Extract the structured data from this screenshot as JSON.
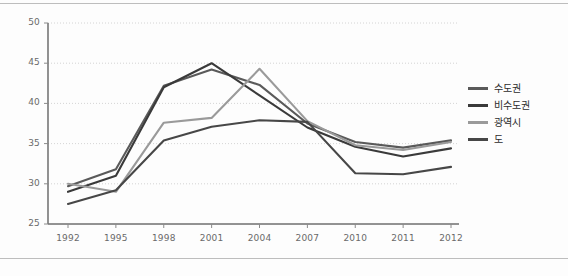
{
  "chart_data": {
    "type": "line",
    "title": "",
    "xlabel": "",
    "ylabel": "",
    "x": [
      "1992",
      "1995",
      "1998",
      "2001",
      "2004",
      "2007",
      "2010",
      "2011",
      "2012"
    ],
    "ylim": [
      25,
      50
    ],
    "yticks": [
      25,
      30,
      35,
      40,
      45,
      50
    ],
    "grid": true,
    "legend_position": "right",
    "series": [
      {
        "name": "수도권",
        "color": "#5a5a5a",
        "values": [
          29.7,
          31.8,
          42.2,
          44.2,
          42.3,
          37.5,
          35.2,
          34.5,
          35.4
        ]
      },
      {
        "name": "비수도권",
        "color": "#3a3a3a",
        "values": [
          29.0,
          31.0,
          42.0,
          45.0,
          41.0,
          37.0,
          34.6,
          33.4,
          34.4
        ]
      },
      {
        "name": "광역시",
        "color": "#9a9a9a",
        "values": [
          30.0,
          29.0,
          37.6,
          38.2,
          44.3,
          37.8,
          34.8,
          34.2,
          35.2
        ]
      },
      {
        "name": "도",
        "color": "#474747",
        "values": [
          27.5,
          29.2,
          35.4,
          37.1,
          37.9,
          37.7,
          31.3,
          31.2,
          32.1
        ]
      }
    ]
  },
  "legend": {
    "items": [
      {
        "label": "수도권"
      },
      {
        "label": "비수도권"
      },
      {
        "label": "광역시"
      },
      {
        "label": "도"
      }
    ]
  },
  "axes": {
    "y_tick_labels": [
      "50",
      "45",
      "40",
      "35",
      "30",
      "25"
    ],
    "x_tick_labels": [
      "1992",
      "1995",
      "1998",
      "2001",
      "2004",
      "2007",
      "2010",
      "2011",
      "2012"
    ]
  }
}
